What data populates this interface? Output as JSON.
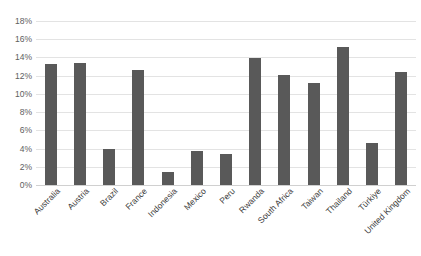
{
  "chart_data": {
    "type": "bar",
    "title": "",
    "xlabel": "",
    "ylabel": "",
    "ylim": [
      0,
      18
    ],
    "ytick_labels": [
      "18%",
      "16%",
      "14%",
      "12%",
      "10%",
      "8%",
      "6%",
      "4%",
      "2%",
      "0%"
    ],
    "ytick_values": [
      18,
      16,
      14,
      12,
      10,
      8,
      6,
      4,
      2,
      0
    ],
    "grid": true,
    "legend": "none",
    "bar_color": "#595959",
    "gridline_color": "#e3e3e3",
    "categories": [
      "Australia",
      "Austria",
      "Brazil",
      "France",
      "Indonesia",
      "Mexico",
      "Peru",
      "Rwanda",
      "South Africa",
      "Taiwan",
      "Thailand",
      "Türkiye",
      "United Kingdom"
    ],
    "values": [
      13.3,
      13.4,
      3.9,
      12.6,
      1.4,
      3.7,
      3.4,
      13.9,
      12.1,
      11.2,
      15.1,
      4.6,
      12.4
    ]
  }
}
